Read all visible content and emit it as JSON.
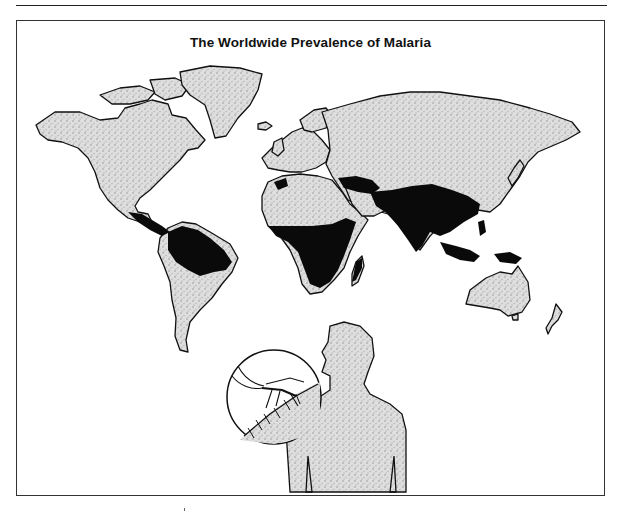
{
  "figure": {
    "title": "The Worldwide Prevalence of Malaria",
    "legend_semantics": {
      "black_fill": "malaria-prevalent regions",
      "stippled_gray_fill": "land without malaria"
    },
    "colors": {
      "malaria": "#0a0a0a",
      "land": "#d6d6d6",
      "outline": "#111111",
      "background": "#ffffff"
    },
    "malaria_regions": [
      "Central America / Mexico south",
      "Northern South America (Amazon basin)",
      "Sub-Saharan Africa",
      "Madagascar",
      "Northwest Africa (Morocco coast)",
      "Middle East / Turkey",
      "South Asia (India)",
      "Southeast Asia / Southern China",
      "Indonesia / Philippines",
      "New Guinea"
    ],
    "inset": {
      "description": "Human silhouette with circular inset showing a mosquito biting skin"
    }
  }
}
